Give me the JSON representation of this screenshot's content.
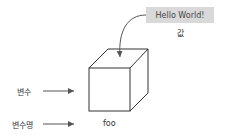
{
  "value_box": {
    "text": "Hello World!",
    "caption": "값"
  },
  "labels": {
    "variable": "변수",
    "variable_name": "변수명",
    "name_value": "foo"
  },
  "colors": {
    "box_bg": "#d9d9d9",
    "stroke": "#333333",
    "arrow": "#555555"
  }
}
